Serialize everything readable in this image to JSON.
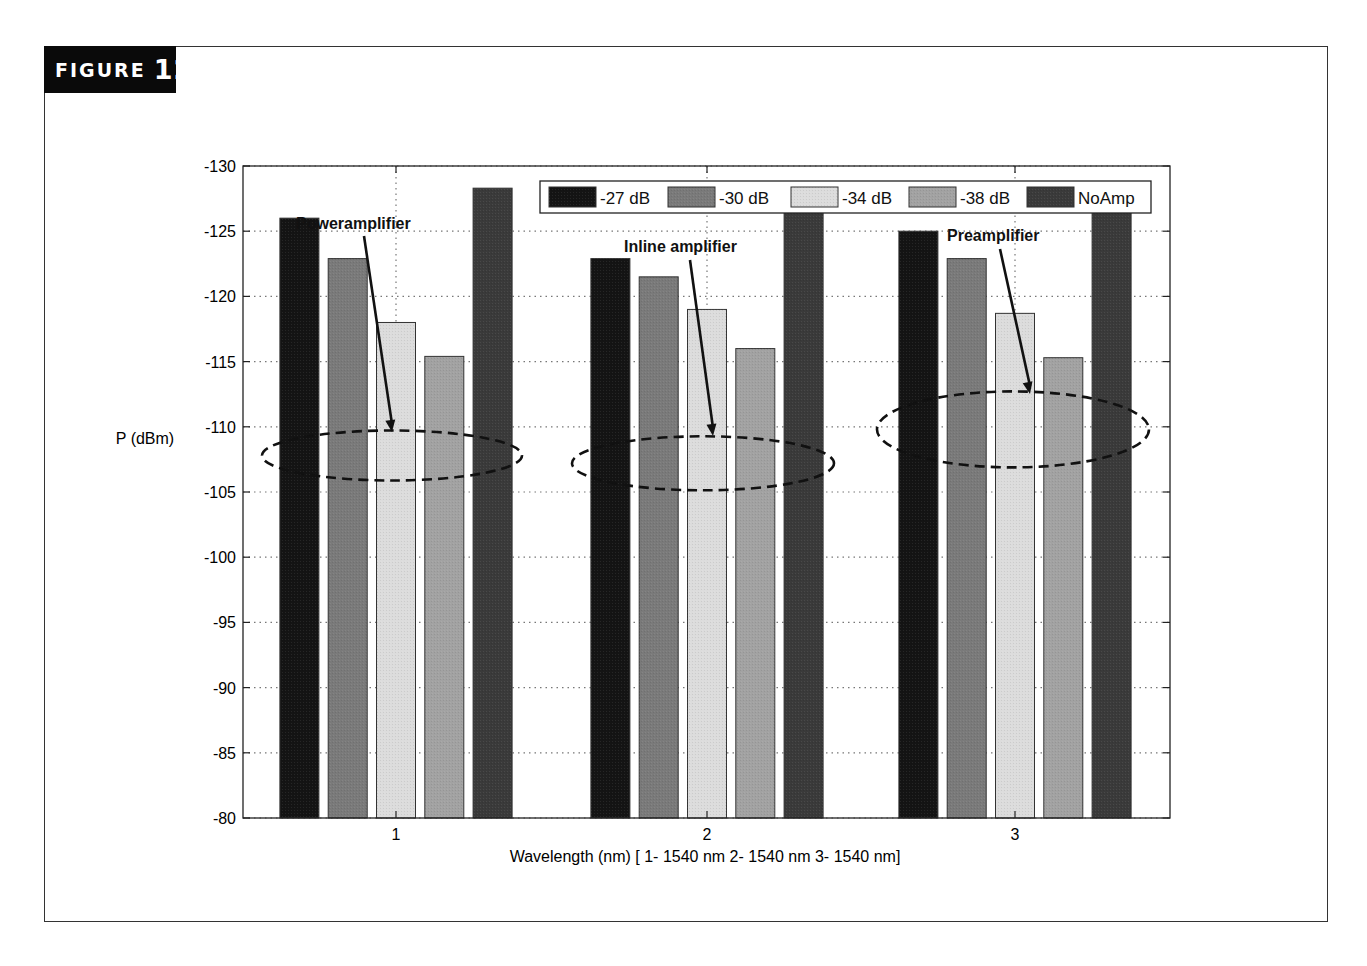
{
  "figure": {
    "label_word": "FIGURE",
    "label_number": "12"
  },
  "chart_data": {
    "type": "bar",
    "title": "",
    "xlabel": "Wavelength (nm) [ 1- 1540 nm 2- 1540 nm 3- 1540 nm]",
    "ylabel": "P (dBm)",
    "categories": [
      "1",
      "2",
      "3"
    ],
    "ylim": [
      -80,
      -130
    ],
    "y_axis_inverted": true,
    "yticks": [
      -130,
      -125,
      -120,
      -115,
      -110,
      -105,
      -100,
      -95,
      -90,
      -85,
      -80
    ],
    "grid": true,
    "legend_position": "top-right inside",
    "series": [
      {
        "name": "-27 dB",
        "color": "#141414",
        "values": [
          -126.0,
          -122.9,
          -125.0
        ]
      },
      {
        "name": "-30 dB",
        "color": "#7a7a7a",
        "values": [
          -122.9,
          -121.5,
          -122.9
        ]
      },
      {
        "name": "-34 dB",
        "color": "#dcdcdc",
        "values": [
          -118.0,
          -119.0,
          -118.7
        ]
      },
      {
        "name": "-38 dB",
        "color": "#a2a2a2",
        "values": [
          -115.4,
          -116.0,
          -115.3
        ]
      },
      {
        "name": "NoAmp",
        "color": "#3a3a3a",
        "values": [
          -128.3,
          -128.0,
          -128.0
        ]
      }
    ],
    "annotations": [
      {
        "text": "Poweramplifier",
        "group": "1",
        "ellipse_center_value": -107.8
      },
      {
        "text": "Inline amplifier",
        "group": "2",
        "ellipse_center_value": -107.2
      },
      {
        "text": "Preamplifier",
        "group": "3",
        "ellipse_center_value": -109.8
      }
    ]
  }
}
